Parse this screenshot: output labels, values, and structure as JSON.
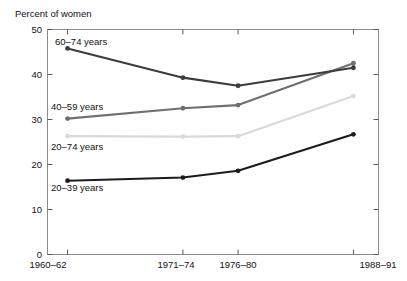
{
  "chart_data": {
    "type": "line",
    "title": "",
    "subtitle": "",
    "ylabel": "Percent of women",
    "xlabel": "",
    "categories": [
      "1960–62",
      "1971–74",
      "1976–80",
      "1988–91"
    ],
    "x_positions": [
      1961,
      1972.5,
      1978,
      1989.5
    ],
    "xlim": [
      1959.0,
      1992.0
    ],
    "ylim": [
      0,
      50
    ],
    "yticks": [
      0,
      10,
      20,
      30,
      40,
      50
    ],
    "ytick_labels": [
      "0",
      "10",
      "20",
      "30",
      "40",
      "50"
    ],
    "grid": false,
    "legend_position": "inline-labels",
    "series": [
      {
        "name": "60–74 years",
        "color": "#3c3c3c",
        "values": [
          45.8,
          39.3,
          37.5,
          41.5
        ],
        "label_x": 1961.3,
        "label_y": 48.0,
        "marker": "circle"
      },
      {
        "name": "40–59 years",
        "color": "#6f6f6f",
        "values": [
          30.2,
          32.5,
          33.2,
          42.5
        ],
        "label_x": 1961.3,
        "label_y": 32.6,
        "marker": "circle"
      },
      {
        "name": "20–74 years",
        "color": "#d9d9d9",
        "values": [
          26.3,
          26.2,
          26.3,
          35.2
        ],
        "label_x": 1961.3,
        "label_y": 23.3,
        "marker": "circle"
      },
      {
        "name": "20–39 years",
        "color": "#1c1c1c",
        "values": [
          16.4,
          17.1,
          18.6,
          26.7
        ],
        "label_x": 1961.3,
        "label_y": 13.2,
        "marker": "circle"
      }
    ]
  },
  "axes": {
    "y_axis_title": "Percent of women",
    "y_tick_0": "0",
    "y_tick_10": "10",
    "y_tick_20": "20",
    "y_tick_30": "30",
    "y_tick_40": "40",
    "y_tick_50": "50",
    "x_tick_0": "1960–62",
    "x_tick_1": "1971–74",
    "x_tick_2": "1976–80",
    "x_tick_3": "1988–91"
  },
  "series_labels": {
    "s0": "60–74 years",
    "s1": "40–59 years",
    "s2": "20–74 years",
    "s3": "20–39 years"
  }
}
